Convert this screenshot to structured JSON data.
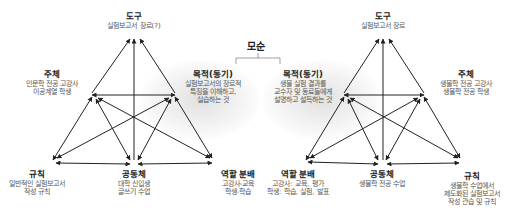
{
  "conflict": {
    "label": "모순"
  },
  "left_system": {
    "tool": {
      "title": "도구",
      "desc": [
        "실험보고서 장르(?)"
      ]
    },
    "subject": {
      "title": "주체",
      "desc": [
        "인문학 전공 고강사",
        "이공계열 학생"
      ]
    },
    "object": {
      "title": "목적(동기)",
      "desc": [
        "실험보고서의 장르적",
        "특징을 이해하고,",
        "실습하는 것"
      ]
    },
    "rules": {
      "title": "규칙",
      "desc": [
        "일반적인 실험보고서",
        "작성 규칙"
      ]
    },
    "community": {
      "title": "공동체",
      "desc": [
        "대학 신입생",
        "글쓰기 수업"
      ]
    },
    "division_of_labor": {
      "title": "역할 분배",
      "desc": [
        "고강사-교육",
        "학생-학습"
      ]
    }
  },
  "right_system": {
    "tool": {
      "title": "도구",
      "desc": [
        "실험보고서 장르"
      ]
    },
    "object": {
      "title": "목적(동기)",
      "desc": [
        "생물 실험 결과를",
        "교수자 및 동료들에게",
        "설명하고 설득하는 것"
      ]
    },
    "subject": {
      "title": "주체",
      "desc": [
        "생물학 전공 고강사",
        "생물학 전공 학생"
      ]
    },
    "division_of_labor": {
      "title": "역할 분배",
      "desc": [
        "고강사: 교육, 평가",
        "학생: 학습, 실험, 발표"
      ]
    },
    "community": {
      "title": "공동체",
      "desc": [
        "생물학 전공 수업"
      ]
    },
    "rules": {
      "title": "규칙",
      "desc": [
        "생물학 수업에서",
        "제도화된 실험보고서",
        "작성 관습 및 규칙"
      ]
    }
  },
  "colors": {
    "arrow": "#222222",
    "title": "#222222",
    "desc": "#555555",
    "glow": "#d0d0d0"
  }
}
